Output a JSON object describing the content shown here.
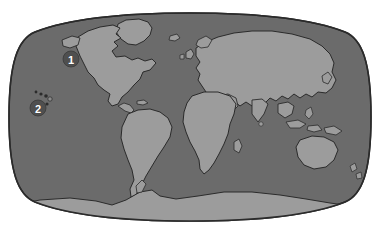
{
  "map": {
    "title": "World map",
    "projection": "winkel-tripel",
    "colors": {
      "background": "#ffffff",
      "ocean": "#6b6b6b",
      "land": "#9c9c9c",
      "outline": "#2b2b2b",
      "graticule": "#5e5e5e",
      "marker_fill": "#4f4f4f",
      "marker_text": "#ffffff"
    },
    "markers": [
      {
        "id": "marker-1",
        "label": "1",
        "region": "North Pacific Ocean off northwest North America",
        "x": 71,
        "y": 59,
        "radius": 8
      },
      {
        "id": "marker-2",
        "label": "2",
        "region": "Central Pacific Ocean near Hawaiian Islands",
        "x": 38,
        "y": 108,
        "radius": 8
      }
    ],
    "landmasses": [
      {
        "name": "north-america"
      },
      {
        "name": "south-america"
      },
      {
        "name": "greenland"
      },
      {
        "name": "europe"
      },
      {
        "name": "africa"
      },
      {
        "name": "asia"
      },
      {
        "name": "australia"
      },
      {
        "name": "new-zealand"
      },
      {
        "name": "antarctica"
      },
      {
        "name": "hawaiian-islands"
      },
      {
        "name": "madagascar"
      },
      {
        "name": "japan"
      },
      {
        "name": "indonesia"
      },
      {
        "name": "philippines"
      },
      {
        "name": "british-isles"
      },
      {
        "name": "iceland"
      },
      {
        "name": "caribbean"
      },
      {
        "name": "new-guinea"
      },
      {
        "name": "sri-lanka"
      }
    ]
  }
}
